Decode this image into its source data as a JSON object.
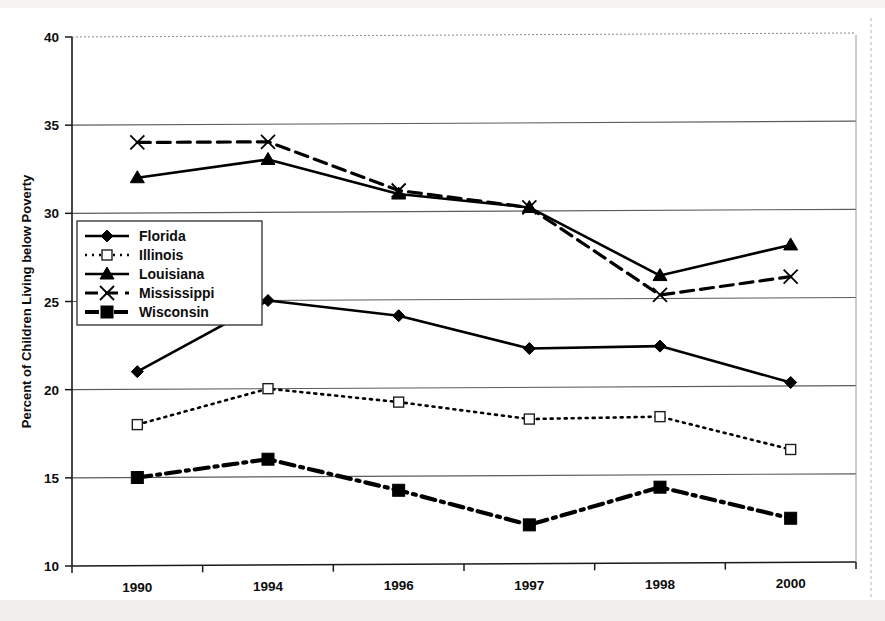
{
  "chart_data": {
    "type": "line",
    "title": "",
    "xlabel": "",
    "ylabel": "Percent of Children Living below Poverty",
    "categories": [
      "1990",
      "1994",
      "1996",
      "1997",
      "1998",
      "2000"
    ],
    "ylim": [
      10,
      40
    ],
    "yticks": [
      "10",
      "15",
      "20",
      "25",
      "30",
      "35",
      "40"
    ],
    "grid": true,
    "legend_position": "inside-left",
    "series": [
      {
        "name": "Florida",
        "marker": "filled-diamond",
        "dash": "solid",
        "color": "#000000",
        "values": [
          21.0,
          25.0,
          24.1,
          22.2,
          22.3,
          20.2
        ]
      },
      {
        "name": "Illinois",
        "marker": "open-square",
        "dash": "dotted",
        "color": "#000000",
        "values": [
          18.0,
          20.0,
          19.2,
          18.2,
          18.3,
          16.4
        ]
      },
      {
        "name": "Louisiana",
        "marker": "filled-triangle",
        "dash": "solid",
        "color": "#000000",
        "values": [
          32.0,
          33.0,
          31.0,
          30.2,
          26.3,
          28.0
        ]
      },
      {
        "name": "Mississippi",
        "marker": "cross-x",
        "dash": "dashed",
        "color": "#000000",
        "values": [
          34.0,
          34.0,
          31.2,
          30.2,
          25.2,
          26.2
        ]
      },
      {
        "name": "Wisconsin",
        "marker": "filled-square",
        "dash": "dashdot",
        "color": "#000000",
        "values": [
          15.0,
          16.0,
          14.2,
          12.2,
          14.3,
          12.5
        ]
      }
    ]
  }
}
